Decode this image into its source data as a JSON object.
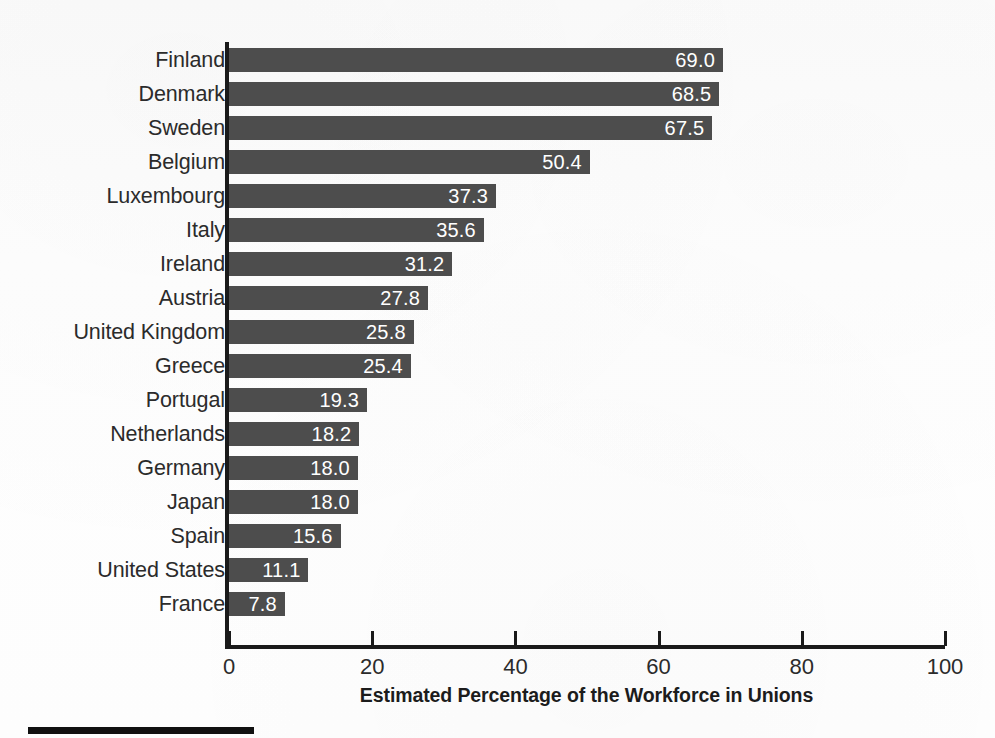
{
  "figure": {
    "background_color": "#fdfdfd",
    "bar_color": "#4d4d4d",
    "axis_color": "#1a1a1a",
    "value_label_color": "#ffffff",
    "rule_color": "#111111"
  },
  "chart_data": {
    "type": "bar",
    "orientation": "horizontal",
    "title": "",
    "xlabel": "Estimated Percentage of the Workforce in Unions",
    "ylabel": "",
    "xlim": [
      0,
      100
    ],
    "xticks": [
      "0",
      "20",
      "40",
      "60",
      "80",
      "100"
    ],
    "xtick_values": [
      0,
      20,
      40,
      60,
      80,
      100
    ],
    "grid": false,
    "legend": null,
    "value_labels": true,
    "categories": [
      "Finland",
      "Denmark",
      "Sweden",
      "Belgium",
      "Luxembourg",
      "Italy",
      "Ireland",
      "Austria",
      "United Kingdom",
      "Greece",
      "Portugal",
      "Netherlands",
      "Germany",
      "Japan",
      "Spain",
      "United States",
      "France"
    ],
    "values": [
      69.0,
      68.5,
      67.5,
      50.4,
      37.3,
      35.6,
      31.2,
      27.8,
      25.8,
      25.4,
      19.3,
      18.2,
      18.0,
      18.0,
      15.6,
      11.1,
      7.8
    ],
    "value_text": [
      "69.0",
      "68.5",
      "67.5",
      "50.4",
      "37.3",
      "35.6",
      "31.2",
      "27.8",
      "25.8",
      "25.4",
      "19.3",
      "18.2",
      "18.0",
      "18.0",
      "15.6",
      "11.1",
      "7.8"
    ]
  }
}
